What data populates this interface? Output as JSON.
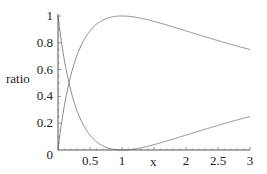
{
  "chart_data": {
    "type": "line",
    "title": "",
    "xlabel": "x",
    "ylabel": "ratio",
    "xlim": [
      0,
      3
    ],
    "ylim": [
      0,
      1
    ],
    "x_ticks": [
      "0.5",
      "1",
      "2",
      "2.5",
      "3"
    ],
    "x_tick_values": [
      0.5,
      1,
      2,
      2.5,
      3
    ],
    "y_ticks": [
      "0",
      "0.2",
      "0.4",
      "0.6",
      "0.8",
      "1"
    ],
    "y_tick_values": [
      0,
      0.2,
      0.4,
      0.6,
      0.8,
      1
    ],
    "grid": false,
    "legend": null,
    "x": [
      0,
      0.1,
      0.2,
      0.3,
      0.4,
      0.5,
      0.6,
      0.7,
      0.8,
      0.9,
      1.0,
      1.25,
      1.5,
      1.75,
      2.0,
      2.25,
      2.5,
      2.75,
      3.0
    ],
    "series": [
      {
        "name": "curve-rising",
        "color": "#888888",
        "values": [
          0,
          0.331,
          0.556,
          0.71,
          0.816,
          0.889,
          0.938,
          0.969,
          0.988,
          0.997,
          1.0,
          0.988,
          0.96,
          0.926,
          0.889,
          0.852,
          0.816,
          0.783,
          0.75
        ]
      },
      {
        "name": "curve-falling",
        "color": "#888888",
        "values": [
          1,
          0.669,
          0.444,
          0.29,
          0.184,
          0.111,
          0.062,
          0.031,
          0.012,
          0.003,
          0.0,
          0.012,
          0.04,
          0.074,
          0.111,
          0.148,
          0.184,
          0.217,
          0.25
        ]
      }
    ]
  },
  "axes": {
    "xlabel": "x",
    "ylabel": "ratio",
    "origin_label": "0"
  }
}
